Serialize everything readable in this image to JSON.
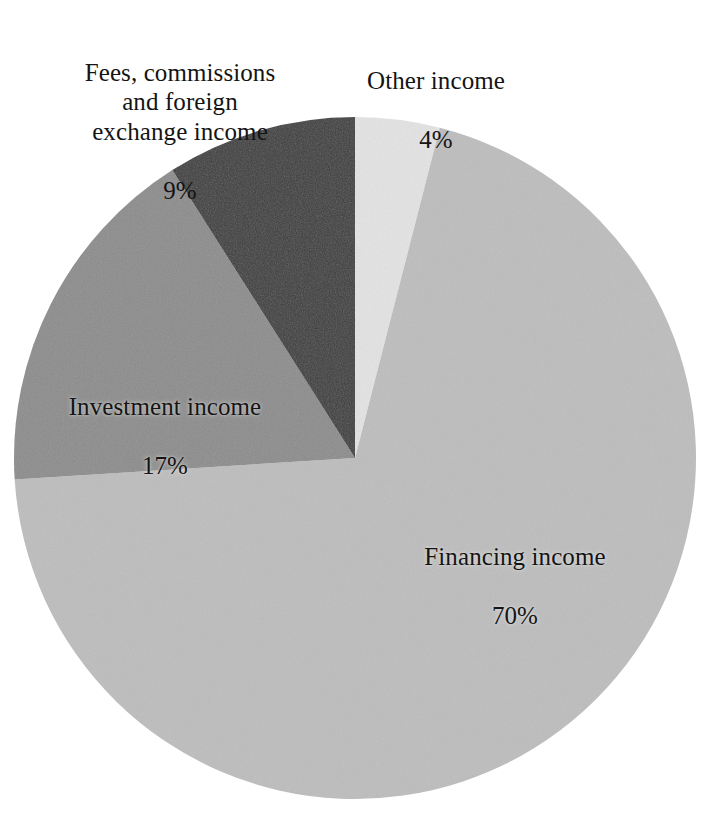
{
  "figure": {
    "background_color": "#ffffff",
    "text_color": "#141414"
  },
  "chart_data": {
    "type": "pie",
    "title": "",
    "subtitle": "",
    "xlabel": "",
    "ylabel": "",
    "legend_position": "none",
    "grid": false,
    "units": "percent",
    "start_angle_deg": 0,
    "direction": "clockwise",
    "center": {
      "x": 355,
      "y": 458
    },
    "radius": 341,
    "categories": [
      "Other income",
      "Financing income",
      "Investment income",
      "Fees, commissions and foreign exchange income"
    ],
    "values": [
      4,
      70,
      17,
      9
    ],
    "slices": [
      {
        "label": "Other income",
        "label_lines": "Other income",
        "value": 4,
        "value_text": "4%",
        "color": "#e3e3e3",
        "start_angle_deg": 0,
        "end_angle_deg": 14.4
      },
      {
        "label": "Financing income",
        "label_lines": "Financing income",
        "value": 70,
        "value_text": "70%",
        "color": "#bdbdbd",
        "start_angle_deg": 14.4,
        "end_angle_deg": 266.4
      },
      {
        "label": "Investment income",
        "label_lines": "Investment income",
        "value": 17,
        "value_text": "17%",
        "color": "#8c8c8c",
        "start_angle_deg": 266.4,
        "end_angle_deg": 327.6
      },
      {
        "label": "Fees, commissions and foreign exchange income",
        "label_lines": "Fees, commissions\nand foreign\nexchange income",
        "value": 9,
        "value_text": "9%",
        "color": "#3c3c3c",
        "start_angle_deg": 327.6,
        "end_angle_deg": 360
      }
    ]
  }
}
